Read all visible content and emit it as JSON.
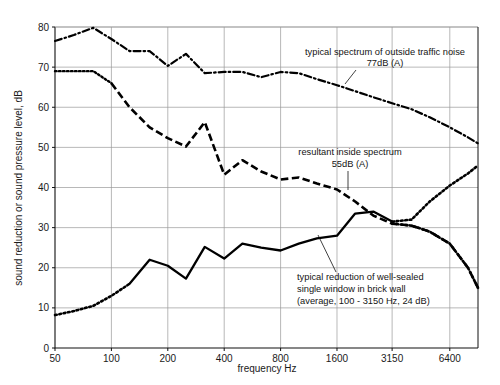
{
  "chart_data": {
    "type": "line",
    "title": "",
    "xlabel": "frequency Hz",
    "ylabel": "sound reduction or sound pressure level, dB",
    "xscale": "log",
    "xlim": [
      50,
      9051
    ],
    "ylim": [
      0,
      80
    ],
    "grid": true,
    "legend_position": "inline-annotations",
    "xticks": [
      50,
      100,
      200,
      400,
      800,
      1600,
      3150,
      6400
    ],
    "xtick_labels": [
      "50",
      "100",
      "200",
      "400",
      "800",
      "1600",
      "3150",
      "6400"
    ],
    "yticks": [
      0,
      10,
      20,
      30,
      40,
      50,
      60,
      70,
      80
    ],
    "ytick_labels": [
      "0",
      "10",
      "20",
      "30",
      "40",
      "50",
      "60",
      "70",
      "80"
    ],
    "series": [
      {
        "name": "typical spectrum of outside traffic noise 77dB (A)",
        "style": "dash-dot",
        "x": [
          50,
          63,
          80,
          100,
          125,
          160,
          200,
          250,
          315,
          400,
          500,
          630,
          800,
          1000,
          1250,
          1600,
          2000,
          2500,
          3150,
          4000,
          5000,
          6400,
          8000,
          9051
        ],
        "values": [
          76.5,
          78.0,
          79.8,
          77.0,
          74.0,
          74.0,
          70.3,
          73.3,
          68.5,
          68.8,
          68.8,
          67.5,
          68.8,
          68.5,
          67.0,
          65.5,
          64.0,
          62.5,
          61.0,
          59.5,
          57.5,
          55.0,
          52.5,
          51.0
        ]
      },
      {
        "name": "resultant inside spectrum 55dB (A)",
        "style": "dotted-then-dashed",
        "x": [
          50,
          63,
          80,
          100,
          125,
          160,
          200,
          250,
          315,
          400,
          500,
          630,
          800,
          1000,
          1250,
          1600,
          2000,
          2500,
          3150,
          4000,
          5000,
          6400,
          8000,
          9051
        ],
        "values": [
          69.0,
          69.0,
          69.0,
          66.0,
          60.0,
          55.0,
          52.3,
          50.2,
          56.3,
          43.2,
          46.8,
          44.0,
          42.0,
          42.5,
          41.0,
          39.5,
          36.5,
          33.0,
          31.0,
          30.5,
          29.0,
          26.0,
          20.0,
          15.0
        ]
      },
      {
        "name": "typical reduction of well-sealed single window in brick wall (average, 100-3150 Hz, 24 dB)",
        "style": "dotted-then-solid-then-dotted",
        "x": [
          50,
          63,
          80,
          100,
          125,
          160,
          200,
          250,
          315,
          400,
          500,
          630,
          800,
          1000,
          1250,
          1600,
          2000,
          2500,
          3150,
          4000,
          5000,
          6400,
          8000,
          9051
        ],
        "values": [
          8.2,
          9.2,
          10.5,
          13.0,
          16.0,
          22.0,
          20.5,
          17.3,
          25.2,
          22.3,
          26.0,
          25.0,
          24.3,
          26.0,
          27.3,
          28.0,
          33.5,
          34.0,
          31.5,
          32.0,
          36.5,
          40.5,
          43.5,
          45.5
        ]
      }
    ],
    "annotations": [
      {
        "id": "outside-traffic-noise",
        "lines": [
          "typical spectrum of outside traffic noise",
          "77dB (A)"
        ],
        "align": "center"
      },
      {
        "id": "inside-spectrum",
        "lines": [
          "resultant inside spectrum",
          "55dB (A)"
        ],
        "align": "center"
      },
      {
        "id": "window-reduction",
        "lines": [
          "typical reduction of well-sealed",
          "single window in brick wall",
          "(average, 100 - 3150 Hz, 24 dB)"
        ],
        "align": "left"
      }
    ],
    "colors": {
      "ink": "#000000",
      "grid": "#9a9a9a",
      "background": "#ffffff"
    }
  }
}
